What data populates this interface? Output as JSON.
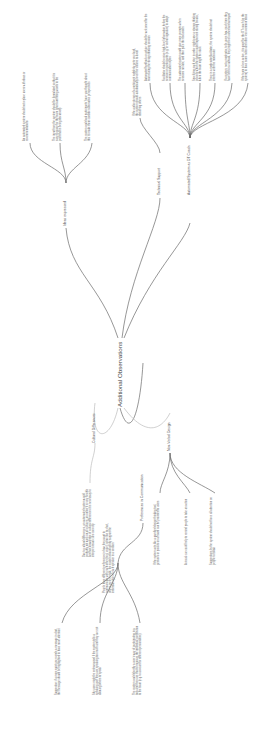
{
  "root": {
    "label": "Additional Observations"
  },
  "branches": [
    {
      "label": "Ideas expressed",
      "leaves": [
        "An automated system should not replace users with ideas or recommendations",
        "The input from the system should be formulated so that it is easy to grasp for the team (short and fitting words to the point that is being discussed)",
        "The system could ask participants 'have you thought about this' to make them consider alternative perspectives"
      ]
    },
    {
      "label": "Technical Support",
      "leaves": [
        "If the audio stream of a participant suddenly gets very loud, the system should automatically level the volume to avoid disturbing others"
      ]
    },
    {
      "label": "Automated System as DT Coach",
      "leaves": [
        "Automated feedback or advice should be welcomed for the team during the design thinking session",
        "Facilitator should receive high-level information before the session on participants (e.g. in verbal signature) to adapt communication styles",
        "The automated system could give more prompts when sessions run late, and then pace the discussion",
        "Specifying each step in order might ease a strange thinking process which the system could implement during breaks, when the team might be stuck",
        "There is a moderator/facilitator; the system should not interfere with the moderator",
        "If a system, not a moderator, tells users how much time they have left for a subtask, they might feel rushed and annoyed",
        "If the team is less active, it is good for the DT coach (or the system) to have some notes and other less common ideas"
      ]
    },
    {
      "label": "Cultural Differences",
      "leaves": [
        "Due to cultural differences, an automated system would probably not work on all cultures; an online it is very flexible and has knowledge of cultural differences it is necessary to interpret visual cues correctly"
      ]
    },
    {
      "label": "Preferences in Communication",
      "leaves": [
        "People have different preferences in how they want to communicate with each other (text, voice); some like to chat, others prefer to talk; the system should gently support the individual style of each speaker in a session",
        "Suggestion: if a more quiet user sends a message in chat, the message should be highlighted to have more attention",
        "Shy users might be embarrassed if the system tells a speaking user they are speaking too much and they are not allowing others to speak",
        "The system could identify a user's way of participating in a task and then use that to measure the individual contribution to the team (e.g. to account for different personalities)"
      ]
    },
    {
      "label": "Non-Verbal Design",
      "leaves": [
        "If the system acts like a gamified design thinking tool, gestures or post-its on a board can be provided to users",
        "A visual cue could help to remind people to take an action",
        "Suggestions by the system should not force all attention on people to follow"
      ]
    }
  ],
  "colors": {
    "background": "#ffffff",
    "link": "#6a6a6a",
    "text": "#555555"
  }
}
